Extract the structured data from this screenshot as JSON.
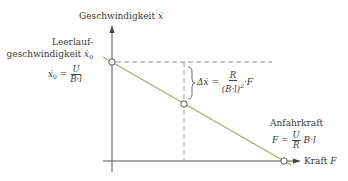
{
  "axes": {
    "y_label": "Geschwindigkeit",
    "y_symbol": "ẋ",
    "x_label": "Kraft",
    "x_symbol": "F"
  },
  "annotations": {
    "idle_speed_line1": "Leerlauf-",
    "idle_speed_line2": "geschwindigkeit",
    "idle_speed_symbol": "ẋ",
    "idle_speed_sub": "0",
    "idle_formula_lhs": "ẋ",
    "idle_formula_sub": "0",
    "idle_formula_eq": "=",
    "idle_formula_num": "U",
    "idle_formula_den": "B·l",
    "delta_lhs": "Δẋ =",
    "delta_num": "R",
    "delta_den": "(B·l)",
    "delta_den_exp": "2",
    "delta_tail": "·F",
    "start_force_label": "Anfahrkraft",
    "start_formula_lhs": "F =",
    "start_formula_num": "U",
    "start_formula_den": "R",
    "start_formula_tail": "B·l"
  },
  "colors": {
    "axis": "#555555",
    "line": "#a9a86c",
    "dashed": "#777777"
  }
}
